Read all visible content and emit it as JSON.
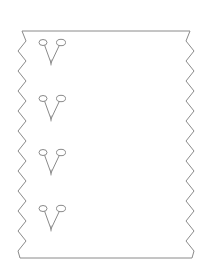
{
  "figure": {
    "title": "Sawtooth-edged trapezoid with four paired-pin glyphs",
    "background_color": "#ffffff",
    "line_color": "#8a8a8a",
    "fill_color": "#ffffff",
    "line_width": 1,
    "width": 212,
    "height": 269
  },
  "outline": {
    "name": "sawtooth-trapezoid",
    "shape_type": "trapezoid",
    "top_edge": {
      "left_x": 22,
      "right_x": 190,
      "y": 31,
      "width": 168
    },
    "bottom_edge": {
      "left_x": 20,
      "right_x": 192,
      "y": 258,
      "width": 172
    },
    "left_edge": {
      "label": "zigzag-left",
      "teeth": 11,
      "tooth_depth": 7,
      "tooth_period": 20
    },
    "right_edge": {
      "label": "zigzag-right",
      "teeth": 11,
      "tooth_depth": 8,
      "tooth_period": 20
    },
    "path": "M 22 31 L 190 31 L 186 41 L 194 51 L 186 61 L 194 71 L 186 81 L 194 91 L 186 101 L 194 111 L 186 121 L 194 131 L 186 141 L 194 151 L 186 161 L 194 171 L 186 181 L 194 191 L 186 201 L 194 211 L 186 221 L 194 231 L 186 241 L 194 251 L 192 258 L 20 258 L 18 251 L 26 241 L 18 231 L 26 221 L 18 211 L 26 201 L 18 191 L 26 181 L 18 171 L 26 161 L 18 151 L 26 141 L 18 131 L 26 121 L 18 111 L 26 101 L 18 91 L 26 81 L 18 71 L 26 61 L 18 51 L 26 41 Z"
  },
  "glyphs": {
    "count": 4,
    "semantic_name": "paired-pin-v-glyph",
    "shape_note": "A narrow V stroke whose two upper arms each terminate in a small open oval loop, resembling two pins or a tuning fork.",
    "items": [
      {
        "index": 1,
        "label": "glyph-1",
        "center_x": 51,
        "top_y": 40,
        "apex_y": 63,
        "width": 22,
        "height": 23
      },
      {
        "index": 2,
        "label": "glyph-2",
        "center_x": 51,
        "top_y": 96,
        "apex_y": 119,
        "width": 22,
        "height": 23
      },
      {
        "index": 3,
        "label": "glyph-3",
        "center_x": 51,
        "top_y": 150,
        "apex_y": 173,
        "width": 22,
        "height": 23
      },
      {
        "index": 4,
        "label": "glyph-4",
        "center_x": 51,
        "top_y": 206,
        "apex_y": 229,
        "width": 22,
        "height": 23
      }
    ]
  }
}
